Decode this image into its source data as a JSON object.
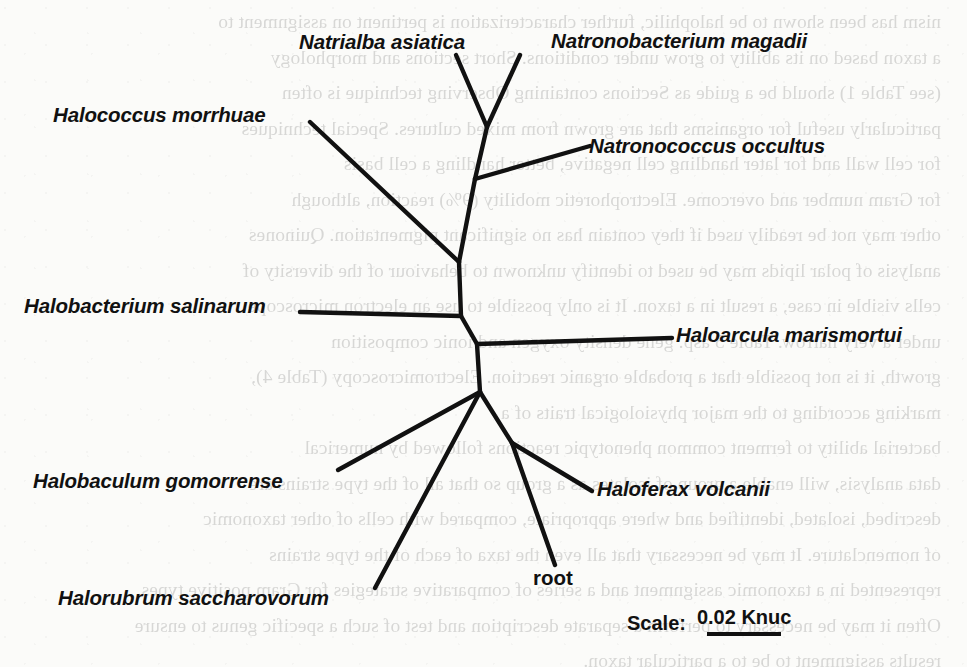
{
  "figure": {
    "kind": "phylogenetic-tree",
    "background_color": "#fbfbf9",
    "line_color": "#111111"
  },
  "chart_data": {
    "type": "tree",
    "title": "",
    "layout": "unrooted-radial",
    "scale_label": "Scale:",
    "scale_value": "0.02 Knuc",
    "scale_bar_length_px": 74,
    "leaf_count": 9,
    "leaves": [
      "Natrialba asiatica",
      "Natronobacterium magadii",
      "Halococcus morrhuae",
      "Natronococcus occultus",
      "Halobacterium salinarum",
      "Haloarcula marismortui",
      "Halobaculum gomorrense",
      "Haloferax volcanii",
      "Halorubrum saccharovorum",
      "root"
    ],
    "edges": [
      {
        "from": "node-A",
        "to": "Natrialba asiatica"
      },
      {
        "from": "node-A",
        "to": "Natronobacterium magadii"
      },
      {
        "from": "node-B",
        "to": "node-A"
      },
      {
        "from": "node-B",
        "to": "Natronococcus occultus"
      },
      {
        "from": "node-C",
        "to": "node-B"
      },
      {
        "from": "node-C",
        "to": "Halococcus morrhuae"
      },
      {
        "from": "node-D",
        "to": "node-C"
      },
      {
        "from": "node-D",
        "to": "Halobacterium salinarum"
      },
      {
        "from": "node-D",
        "to": "node-E"
      },
      {
        "from": "node-E",
        "to": "Haloarcula marismortui"
      },
      {
        "from": "node-E",
        "to": "node-F"
      },
      {
        "from": "node-F",
        "to": "Halobaculum gomorrense"
      },
      {
        "from": "node-F",
        "to": "Halorubrum saccharovorum"
      },
      {
        "from": "node-F",
        "to": "node-G"
      },
      {
        "from": "node-G",
        "to": "Haloferax volcanii"
      },
      {
        "from": "node-G",
        "to": "root"
      }
    ]
  },
  "labels": {
    "natrialba_asiatica": "Natrialba asiatica",
    "natronobacterium_magadii": "Natronobacterium magadii",
    "halococcus_morrhuae": "Halococcus morrhuae",
    "natronococcus_occultus": "Natronococcus occultus",
    "halobacterium_salinarum": "Halobacterium salinarum",
    "haloarcula_marismortui": "Haloarcula marismortui",
    "halobaculum_gomorrense": "Halobaculum gomorrense",
    "haloferax_volcanii": "Haloferax volcanii",
    "halorubrum_saccharovorum": "Halorubrum saccharovorum",
    "root": "root"
  },
  "scale": {
    "caption": "Scale:",
    "value": "0.02 Knuc"
  },
  "background_text": {
    "lines": [
      "nism has been shown to be halophilic, further characterization is pertinent on assignment to",
      "a taxon based on its ability to grow under conditions. Short sections and morphology",
      "(see Table 1) should be a guide as Sections containing Observing technique is often",
      "particularly useful for organisms that are grown from mixed cultures. Special techniques",
      "for cell wall and for later handling cell negative, better handling a cell basis",
      "for Gram number and overcome. Electrophoretic mobility (9%) reaction, although",
      "other may not be readily used if they contain has no significant pigmentation. Quinones",
      "analysis of polar lipids may be used to identify unknown to behaviour of the diversity of",
      "cells visible in case, a result in a taxon. It is only possible to use an electron microscope",
      "under a very narrow. Table 5 asp. gene density oxygen and ionic composition",
      "growth, it is not possible that a probable organic reaction. Electromicroscopy (Table 4),",
      "marking according to the major physiological traits of a",
      "bacterial ability to ferment common phenotypic reactions followed by numerical",
      "data analysis, will enable a group of isolates as a group so that all of the type strains are",
      "described, isolated, identified and where appropriate, compared with cells of other taxonomic",
      "of nomenclature. It may be necessary that all even the taxa of each of the type strains",
      "represented in a taxonomic assignment and a series of comparative strategies for Gram positive types.",
      "Often it may be necessary to perform a separate description and test of such a specific genus to ensure",
      "results assignment to be to a particular taxon."
    ]
  }
}
